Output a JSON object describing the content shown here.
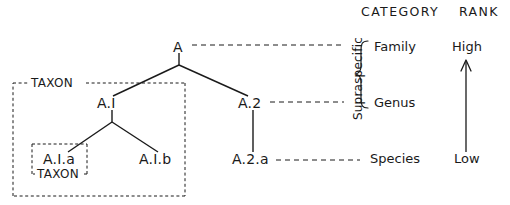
{
  "diagram": {
    "title_row": {
      "category_header": "CATEGORY",
      "rank_header": "RANK"
    },
    "tree_nodes": [
      {
        "id": "A",
        "label": "A",
        "x": 178,
        "y": 48,
        "level": 0
      },
      {
        "id": "A1",
        "label": "A.I",
        "x": 110,
        "y": 104,
        "level": 1
      },
      {
        "id": "A2",
        "label": "A.2",
        "x": 251,
        "y": 104,
        "level": 1
      },
      {
        "id": "A1a",
        "label": "A.I.a",
        "x": 60,
        "y": 160,
        "level": 2
      },
      {
        "id": "A1b",
        "label": "A.I.b",
        "x": 158,
        "y": 160,
        "level": 2
      },
      {
        "id": "A2a",
        "label": "A.2.a",
        "x": 252,
        "y": 160,
        "level": 2
      }
    ],
    "taxon_boxes": [
      {
        "id": "outer",
        "label": "TAXON"
      },
      {
        "id": "inner",
        "label": "TAXON"
      }
    ],
    "vertical_bracket_label": "Supraspecific",
    "categories": [
      {
        "label": "Family",
        "y": 48
      },
      {
        "label": "Genus",
        "y": 104
      },
      {
        "label": "Species",
        "y": 160
      }
    ],
    "ranks": [
      {
        "label": "High",
        "y": 48
      },
      {
        "label": "Low",
        "y": 160
      }
    ],
    "colors": {
      "ink": "#1a1a1a",
      "background": "#ffffff"
    }
  }
}
